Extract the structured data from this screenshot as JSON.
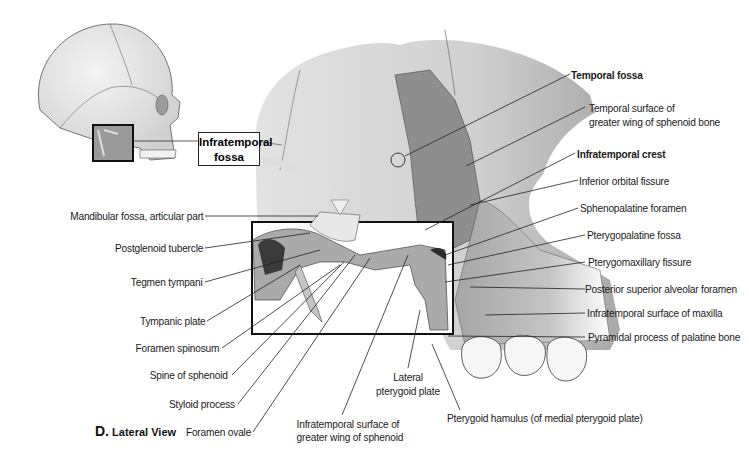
{
  "figure": {
    "view_letter": "D.",
    "view_title": "Lateral View",
    "inset_callout": "Infratemporal fossa",
    "artist_signature": "JOY"
  },
  "labels": {
    "right": [
      {
        "text": "Temporal fossa",
        "bold": true
      },
      {
        "text": "Temporal surface of",
        "bold": false
      },
      {
        "text": "greater wing of sphenoid bone",
        "bold": false
      },
      {
        "text": "Infratemporal crest",
        "bold": true
      },
      {
        "text": "Inferior orbital fissure",
        "bold": false
      },
      {
        "text": "Sphenopalatine foramen",
        "bold": false
      },
      {
        "text": "Pterygopalatine fossa",
        "bold": false
      },
      {
        "text": "Pterygomaxillary fissure",
        "bold": false
      },
      {
        "text": "Posterior superior alveolar foramen",
        "bold": false
      },
      {
        "text": "Infratemporal surface of maxilla",
        "bold": false
      },
      {
        "text": "Pyramidal process of palatine bone",
        "bold": false
      }
    ],
    "left": [
      {
        "text": "Mandibular fossa, articular part"
      },
      {
        "text": "Postglenoid tubercle"
      },
      {
        "text": "Tegmen tympani"
      },
      {
        "text": "Tympanic plate"
      },
      {
        "text": "Foramen spinosum"
      },
      {
        "text": "Spine of sphenoid"
      },
      {
        "text": "Styloid process"
      },
      {
        "text": "Foramen ovale"
      }
    ],
    "bottom": [
      {
        "line1": "Infratemporal surface of",
        "line2": "greater wing of sphenoid"
      },
      {
        "line1": "Lateral",
        "line2": "pterygoid plate"
      },
      {
        "line1": "Pterygoid hamulus (of medial pterygoid plate)",
        "line2": ""
      }
    ]
  },
  "colors": {
    "bone_light": "#e4e4e4",
    "bone_mid": "#b9b9b9",
    "bone_dark": "#8c8c8c",
    "line": "#222222"
  }
}
